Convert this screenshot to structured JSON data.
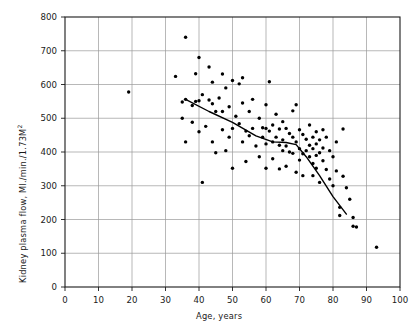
{
  "chart_data": {
    "type": "scatter",
    "title": "",
    "xlabel": "Age, years",
    "ylabel": "Kidney plasma flow, Ml./min./1.73M2",
    "ylabel_display": "Kidney plasma flow, Ml./min./1.73M",
    "ylabel_exponent": "2",
    "xlim": [
      0,
      100
    ],
    "ylim": [
      0,
      800
    ],
    "xticks": [
      0,
      10,
      20,
      30,
      40,
      50,
      60,
      70,
      80,
      90,
      100
    ],
    "yticks": [
      0,
      100,
      200,
      300,
      400,
      500,
      600,
      700,
      800
    ],
    "xtick_labels": [
      "0",
      "10",
      "20",
      "30",
      "40",
      "50",
      "60",
      "70",
      "80",
      "90",
      "100"
    ],
    "ytick_labels": [
      "0",
      "100",
      "200",
      "300",
      "400",
      "500",
      "600",
      "700",
      "800"
    ],
    "grid": true,
    "grid_color": "#9a9a9a",
    "frame_color": "#1a1a1a",
    "legend": null,
    "marker": {
      "shape": "circle",
      "color": "#000000",
      "size_px": 3.4
    },
    "points": [
      [
        19,
        578
      ],
      [
        33,
        624
      ],
      [
        35,
        548
      ],
      [
        35,
        500
      ],
      [
        36,
        740
      ],
      [
        36,
        556
      ],
      [
        36,
        430
      ],
      [
        38,
        538
      ],
      [
        38,
        488
      ],
      [
        39,
        632
      ],
      [
        39,
        550
      ],
      [
        40,
        680
      ],
      [
        40,
        552
      ],
      [
        40,
        460
      ],
      [
        41,
        570
      ],
      [
        41,
        310
      ],
      [
        42,
        476
      ],
      [
        43,
        652
      ],
      [
        43,
        554
      ],
      [
        44,
        607
      ],
      [
        44,
        543
      ],
      [
        44,
        430
      ],
      [
        45,
        520
      ],
      [
        45,
        398
      ],
      [
        46,
        560
      ],
      [
        47,
        631
      ],
      [
        47,
        520
      ],
      [
        47,
        466
      ],
      [
        48,
        590
      ],
      [
        48,
        404
      ],
      [
        49,
        534
      ],
      [
        49,
        444
      ],
      [
        50,
        612
      ],
      [
        50,
        470
      ],
      [
        50,
        352
      ],
      [
        51,
        506
      ],
      [
        52,
        602
      ],
      [
        52,
        484
      ],
      [
        53,
        620
      ],
      [
        53,
        545
      ],
      [
        53,
        430
      ],
      [
        54,
        462
      ],
      [
        54,
        372
      ],
      [
        55,
        520
      ],
      [
        55,
        448
      ],
      [
        56,
        556
      ],
      [
        56,
        470
      ],
      [
        57,
        418
      ],
      [
        58,
        500
      ],
      [
        58,
        386
      ],
      [
        59,
        472
      ],
      [
        59,
        444
      ],
      [
        60,
        540
      ],
      [
        60,
        470
      ],
      [
        60,
        424
      ],
      [
        60,
        352
      ],
      [
        61,
        608
      ],
      [
        61,
        462
      ],
      [
        62,
        480
      ],
      [
        62,
        430
      ],
      [
        62,
        380
      ],
      [
        63,
        512
      ],
      [
        63,
        444
      ],
      [
        64,
        468
      ],
      [
        64,
        420
      ],
      [
        64,
        350
      ],
      [
        65,
        490
      ],
      [
        65,
        436
      ],
      [
        65,
        404
      ],
      [
        66,
        470
      ],
      [
        66,
        418
      ],
      [
        66,
        358
      ],
      [
        67,
        455
      ],
      [
        67,
        400
      ],
      [
        68,
        522
      ],
      [
        68,
        444
      ],
      [
        68,
        396
      ],
      [
        69,
        540
      ],
      [
        69,
        430
      ],
      [
        69,
        340
      ],
      [
        70,
        466
      ],
      [
        70,
        410
      ],
      [
        70,
        376
      ],
      [
        71,
        452
      ],
      [
        71,
        395
      ],
      [
        71,
        330
      ],
      [
        72,
        438
      ],
      [
        72,
        404
      ],
      [
        73,
        480
      ],
      [
        73,
        420
      ],
      [
        73,
        386
      ],
      [
        74,
        444
      ],
      [
        74,
        410
      ],
      [
        74,
        366
      ],
      [
        74,
        330
      ],
      [
        75,
        460
      ],
      [
        75,
        424
      ],
      [
        75,
        390
      ],
      [
        75,
        352
      ],
      [
        76,
        436
      ],
      [
        76,
        398
      ],
      [
        76,
        310
      ],
      [
        77,
        466
      ],
      [
        77,
        412
      ],
      [
        77,
        374
      ],
      [
        78,
        444
      ],
      [
        78,
        348
      ],
      [
        79,
        404
      ],
      [
        79,
        320
      ],
      [
        80,
        386
      ],
      [
        80,
        300
      ],
      [
        81,
        430
      ],
      [
        81,
        344
      ],
      [
        82,
        236
      ],
      [
        82,
        212
      ],
      [
        83,
        468
      ],
      [
        83,
        328
      ],
      [
        84,
        294
      ],
      [
        85,
        260
      ],
      [
        86,
        206
      ],
      [
        86,
        180
      ],
      [
        87,
        178
      ],
      [
        93,
        118
      ]
    ],
    "trend_line": {
      "type": "piecewise-linear",
      "color": "#000000",
      "width_px": 1.4,
      "vertices": [
        [
          36,
          556
        ],
        [
          43,
          520
        ],
        [
          50,
          488
        ],
        [
          57,
          448
        ],
        [
          62,
          430
        ],
        [
          66,
          428
        ],
        [
          69,
          422
        ],
        [
          72,
          386
        ],
        [
          76,
          330
        ],
        [
          80,
          268
        ],
        [
          84,
          216
        ]
      ]
    }
  },
  "axes": {
    "plot_left_px": 65,
    "plot_right_px": 400,
    "plot_top_px": 17,
    "plot_bottom_px": 287
  }
}
